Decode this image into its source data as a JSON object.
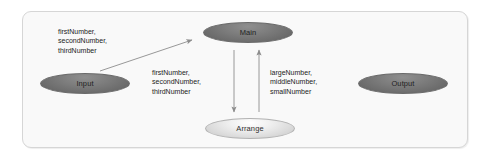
{
  "diagram": {
    "type": "structure-chart",
    "frame": {
      "name": "diagram-frame"
    },
    "nodes": [
      {
        "id": "main",
        "label": "Main",
        "style": "dark"
      },
      {
        "id": "input",
        "label": "Input",
        "style": "dark"
      },
      {
        "id": "output",
        "label": "Output",
        "style": "dark"
      },
      {
        "id": "arrange",
        "label": "Arrange",
        "style": "light"
      }
    ],
    "edges": [
      {
        "id": "input-to-main",
        "from": "input",
        "to": "main",
        "direction": "up-right",
        "label_lines": [
          "firstNumber,",
          "secondNumber,",
          "thirdNumber"
        ]
      },
      {
        "id": "main-to-arrange",
        "from": "main",
        "to": "arrange",
        "direction": "down",
        "label_lines": [
          "firstNumber,",
          "secondNumber,",
          "thirdNumber"
        ]
      },
      {
        "id": "arrange-to-main",
        "from": "arrange",
        "to": "main",
        "direction": "up",
        "label_lines": [
          "largeNumber,",
          "middleNumber,",
          "smallNumber"
        ]
      }
    ],
    "colors": {
      "frame_background": "#f9f9f9",
      "frame_border": "#d6d6d6",
      "node_dark": "#6d6d6d",
      "node_light": "#e2e2e2",
      "edge_stroke": "#8c8c8c",
      "text": "#232323",
      "page_background": "#ffffff"
    }
  }
}
